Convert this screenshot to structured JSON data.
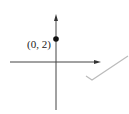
{
  "diagram": {
    "point_label": "(0, 2)",
    "colors": {
      "axes": "#444444",
      "point": "#111111",
      "check": "#b8b8b8"
    }
  }
}
